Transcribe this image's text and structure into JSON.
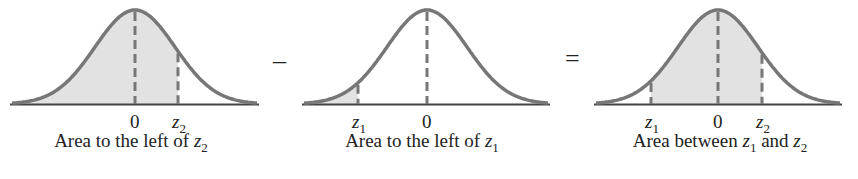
{
  "colors": {
    "curve": "#777777",
    "fill": "#e2e2e2",
    "axis": "#444444",
    "text": "#222222"
  },
  "panels": [
    {
      "caption_pre": "Area to the left of ",
      "caption_var": "z",
      "caption_sub": "2",
      "caption_post": "",
      "ticks": [
        {
          "label": "0"
        },
        {
          "var": "z",
          "sub": "2"
        }
      ]
    },
    {
      "caption_pre": "Area to the left of ",
      "caption_var": "z",
      "caption_sub": "1",
      "caption_post": "",
      "ticks": [
        {
          "var": "z",
          "sub": "1"
        },
        {
          "label": "0"
        }
      ]
    },
    {
      "caption_pre": "Area between ",
      "caption_var": "z",
      "caption_sub": "1",
      "caption_mid": " and ",
      "caption_var2": "z",
      "caption_sub2": "2",
      "ticks": [
        {
          "var": "z",
          "sub": "1"
        },
        {
          "label": "0"
        },
        {
          "var": "z",
          "sub": "2"
        }
      ]
    }
  ],
  "operators": {
    "minus": "–",
    "equals": "="
  }
}
